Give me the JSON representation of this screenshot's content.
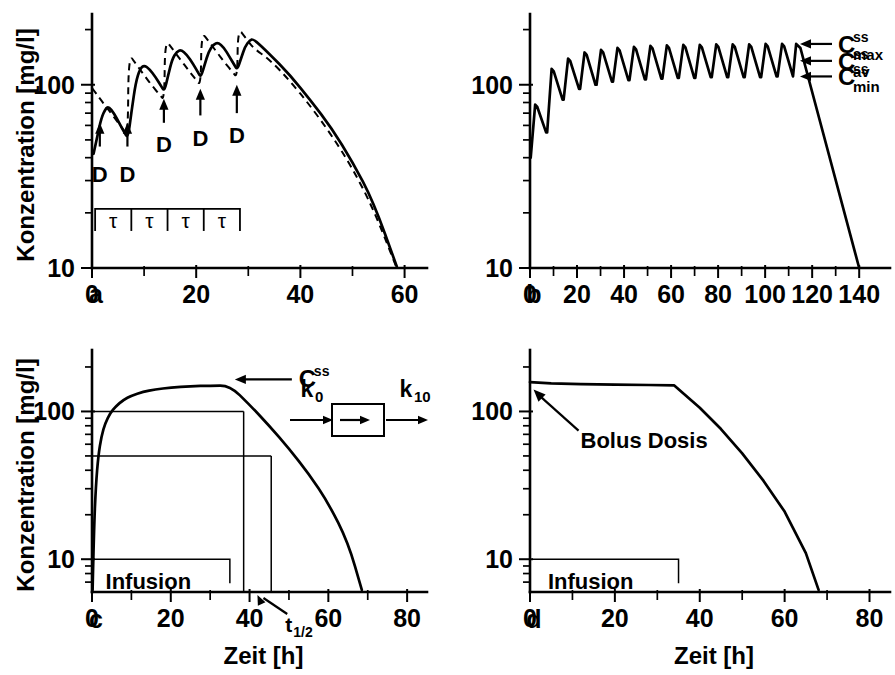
{
  "figure": {
    "background": "#ffffff",
    "ink_color": "#000000"
  },
  "chart_data": [
    {
      "id": "panel-a",
      "type": "line",
      "panel_letter": "a",
      "title": "Multiple oral dosing to steady state",
      "xlabel": "",
      "ylabel": "Konzentration [mg/l]",
      "yscale": "log",
      "ylim": [
        10,
        220
      ],
      "ytick_labels": [
        "100",
        "10"
      ],
      "ytick_values": [
        100,
        10
      ],
      "xlim": [
        0,
        62
      ],
      "xtick_labels": [
        "0",
        "20",
        "40",
        "60"
      ],
      "xtick_values": [
        0,
        20,
        40,
        60
      ],
      "xtick_minor": [
        10,
        30,
        50
      ],
      "grid": false,
      "legend": "none",
      "series": [
        {
          "name": "orale Gabe (solid)",
          "style": "solid",
          "points": [
            [
              0.3,
              42
            ],
            [
              1.0,
              52
            ],
            [
              1.8,
              66
            ],
            [
              2.6,
              74
            ],
            [
              3.2,
              76
            ],
            [
              4.2,
              70
            ],
            [
              5.2,
              62
            ],
            [
              6.2,
              55
            ],
            [
              6.9,
              51
            ],
            [
              7.6,
              72
            ],
            [
              8.4,
              103
            ],
            [
              9.2,
              122
            ],
            [
              10.0,
              128
            ],
            [
              11.0,
              122
            ],
            [
              12.2,
              110
            ],
            [
              13.3,
              98
            ],
            [
              13.9,
              92
            ],
            [
              14.6,
              112
            ],
            [
              15.4,
              138
            ],
            [
              16.3,
              152
            ],
            [
              17.1,
              155
            ],
            [
              18.2,
              146
            ],
            [
              19.4,
              130
            ],
            [
              20.4,
              116
            ],
            [
              20.9,
              110
            ],
            [
              21.6,
              128
            ],
            [
              22.4,
              152
            ],
            [
              23.3,
              166
            ],
            [
              24.2,
              170
            ],
            [
              25.3,
              160
            ],
            [
              26.4,
              142
            ],
            [
              27.4,
              127
            ],
            [
              27.9,
              121
            ],
            [
              28.6,
              139
            ],
            [
              29.4,
              162
            ],
            [
              30.3,
              175
            ],
            [
              31.0,
              178
            ],
            [
              34,
              148
            ],
            [
              38,
              113
            ],
            [
              42,
              82
            ],
            [
              46,
              58
            ],
            [
              50,
              38
            ],
            [
              54,
              23
            ],
            [
              58.5,
              10.2
            ]
          ]
        },
        {
          "name": "i.v. Bolus (dashed)",
          "style": "dashed",
          "points": [
            [
              0.0,
              96
            ],
            [
              1.5,
              84
            ],
            [
              3.0,
              74
            ],
            [
              4.5,
              65
            ],
            [
              6.0,
              57
            ],
            [
              6.9,
              52
            ],
            [
              7.0,
              148
            ],
            [
              8.5,
              129
            ],
            [
              10.0,
              113
            ],
            [
              11.5,
              99
            ],
            [
              13.0,
              88
            ],
            [
              13.9,
              82
            ],
            [
              14.0,
              178
            ],
            [
              15.5,
              156
            ],
            [
              17.0,
              137
            ],
            [
              18.5,
              120
            ],
            [
              20.0,
              106
            ],
            [
              20.9,
              99
            ],
            [
              21.0,
              195
            ],
            [
              22.5,
              171
            ],
            [
              24.0,
              150
            ],
            [
              25.5,
              132
            ],
            [
              27.0,
              117
            ],
            [
              27.9,
              109
            ],
            [
              28.0,
              205
            ],
            [
              29.5,
              180
            ],
            [
              31.0,
              158
            ],
            [
              34,
              138
            ],
            [
              38,
              105
            ],
            [
              42,
              76
            ],
            [
              46,
              53
            ],
            [
              50,
              35
            ],
            [
              54,
              21
            ],
            [
              58.5,
              10.0
            ]
          ]
        }
      ],
      "annotations": [
        {
          "text": "D",
          "x": 1.5,
          "y": 33,
          "kind": "dose-arrow",
          "arrow_from_y": 46,
          "arrow_to_y": 62
        },
        {
          "text": "D",
          "x": 6.8,
          "y": 33,
          "kind": "dose-arrow",
          "arrow_from_y": 46,
          "arrow_to_y": 62
        },
        {
          "text": "D",
          "x": 13.8,
          "y": 48,
          "kind": "dose-arrow",
          "arrow_from_y": 62,
          "arrow_to_y": 84
        },
        {
          "text": "D",
          "x": 20.8,
          "y": 52,
          "kind": "dose-arrow",
          "arrow_from_y": 68,
          "arrow_to_y": 95
        },
        {
          "text": "D",
          "x": 27.8,
          "y": 54,
          "kind": "dose-arrow",
          "arrow_from_y": 70,
          "arrow_to_y": 100
        }
      ],
      "tau_bracket": {
        "label": "τ",
        "count": 4,
        "x_start": 0.6,
        "x_end": 28.4,
        "y_level": 21,
        "labels": [
          "τ",
          "τ",
          "τ",
          "τ"
        ]
      }
    },
    {
      "id": "panel-b",
      "type": "line",
      "panel_letter": "b",
      "title": "Multiple dosing over extended period with steady state levels",
      "xlabel": "",
      "ylabel": "",
      "yscale": "log",
      "ylim": [
        10,
        220
      ],
      "ytick_labels": [
        "100",
        "10"
      ],
      "ytick_values": [
        100,
        10
      ],
      "xlim": [
        0,
        148
      ],
      "xtick_labels": [
        "0",
        "20",
        "40",
        "60",
        "80",
        "100",
        "120",
        "140"
      ],
      "xtick_values": [
        0,
        20,
        40,
        60,
        80,
        100,
        120,
        140
      ],
      "xtick_minor": [
        10,
        30,
        50,
        70,
        90,
        110,
        130
      ],
      "grid": false,
      "legend": "none",
      "dose_interval_h": 7,
      "n_doses": 16,
      "series": [
        {
          "name": "Konzentrationsverlauf",
          "style": "solid",
          "peak_values": [
            78,
            122,
            139,
            150,
            155,
            159,
            161,
            163,
            164,
            165,
            165,
            166,
            166,
            166,
            167,
            167
          ],
          "trough_values": [
            55,
            83,
            95,
            100,
            104,
            106,
            107,
            108,
            109,
            109,
            110,
            110,
            110,
            110,
            111,
            111
          ],
          "terminal_end_x": 140,
          "terminal_end_y": 10
        }
      ],
      "annotations": [
        {
          "text": "C",
          "sup": "ss",
          "sub": "max",
          "kind": "arrow-label",
          "y_value": 167
        },
        {
          "text": "C",
          "sup": "ss",
          "sub": "av",
          "kind": "arrow-label",
          "y_value": 135
        },
        {
          "text": "C",
          "sup": "ss",
          "sub": "min",
          "kind": "arrow-label",
          "y_value": 111
        }
      ]
    },
    {
      "id": "panel-c",
      "type": "line",
      "panel_letter": "c",
      "title": "Constant rate infusion reaching steady state",
      "xlabel": "Zeit [h]",
      "ylabel": "Konzentration [mg/l]",
      "yscale": "log",
      "ylim": [
        6,
        230
      ],
      "ytick_labels": [
        "100",
        "10"
      ],
      "ytick_values": [
        100,
        10
      ],
      "xlim": [
        0,
        82
      ],
      "xtick_labels": [
        "0",
        "20",
        "40",
        "60",
        "80"
      ],
      "xtick_values": [
        0,
        20,
        40,
        60,
        80
      ],
      "xtick_minor": [
        10,
        30,
        50,
        70
      ],
      "grid": false,
      "legend": "none",
      "infusion_stop_h": 35,
      "css_value": 150,
      "half_css_value": 50,
      "hundred_line_value": 100,
      "series": [
        {
          "name": "Infusionskinetik",
          "style": "solid",
          "points": [
            [
              0.15,
              6.2
            ],
            [
              0.5,
              16
            ],
            [
              1.0,
              32
            ],
            [
              1.6,
              50
            ],
            [
              2.4,
              68
            ],
            [
              3.4,
              84
            ],
            [
              4.6,
              97
            ],
            [
              6.0,
              108
            ],
            [
              8.0,
              120
            ],
            [
              10.0,
              128
            ],
            [
              13.0,
              136
            ],
            [
              16.0,
              141
            ],
            [
              20.0,
              145
            ],
            [
              25.0,
              148
            ],
            [
              30.0,
              149.5
            ],
            [
              35.0,
              150
            ],
            [
              40.0,
              111
            ],
            [
              45.0,
              80
            ],
            [
              50.0,
              56
            ],
            [
              55.0,
              38
            ],
            [
              60.0,
              24
            ],
            [
              65.0,
              13
            ],
            [
              68.5,
              6.2
            ]
          ]
        }
      ],
      "annotations": [
        {
          "text": "C",
          "sup": "ss",
          "kind": "css-arrow"
        },
        {
          "text": "Infusion",
          "kind": "infusion-bracket",
          "x_start": 0.5,
          "x_end": 35,
          "y_level": 10
        },
        {
          "text": "t",
          "sub": "1/2",
          "kind": "t-half-arrow",
          "x_first": 38.5,
          "x_second": 45.5
        }
      ],
      "model_box": {
        "input_label": "k",
        "input_sub": "0",
        "output_label": "k",
        "output_sub": "10"
      }
    },
    {
      "id": "panel-d",
      "type": "line",
      "panel_letter": "d",
      "title": "Loading bolus dose plus infusion",
      "xlabel": "Zeit [h]",
      "ylabel": "",
      "yscale": "log",
      "ylim": [
        6,
        230
      ],
      "ytick_labels": [
        "100",
        "10"
      ],
      "ytick_values": [
        100,
        10
      ],
      "xlim": [
        0,
        82
      ],
      "xtick_labels": [
        "0",
        "20",
        "40",
        "60",
        "80"
      ],
      "xtick_values": [
        0,
        20,
        40,
        60,
        80
      ],
      "xtick_minor": [
        10,
        30,
        50,
        70
      ],
      "grid": false,
      "legend": "none",
      "infusion_stop_h": 35,
      "css_value": 152,
      "series": [
        {
          "name": "Bolus + Infusion",
          "style": "solid",
          "points": [
            [
              0.0,
              158
            ],
            [
              5.0,
              155
            ],
            [
              12.0,
              153
            ],
            [
              20.0,
              152
            ],
            [
              28.0,
              151
            ],
            [
              34.0,
              150
            ],
            [
              40.0,
              106
            ],
            [
              45.0,
              76
            ],
            [
              50.0,
              52
            ],
            [
              55.0,
              34
            ],
            [
              60.0,
              21
            ],
            [
              65.0,
              11
            ],
            [
              68.0,
              6.2
            ]
          ]
        }
      ],
      "annotations": [
        {
          "text": "Bolus Dosis",
          "kind": "bolus-arrow"
        },
        {
          "text": "Infusion",
          "kind": "infusion-bracket",
          "x_start": 0.5,
          "x_end": 35,
          "y_level": 10
        }
      ]
    }
  ],
  "labels": {
    "y_axis_title": "Konzentration [mg/l]",
    "x_axis_title": "Zeit [h]",
    "panel_a": "a",
    "panel_b": "b",
    "panel_c": "c",
    "panel_d": "d",
    "dose_marker": "D",
    "tau": "τ",
    "infusion": "Infusion",
    "bolus_dosis": "Bolus Dosis",
    "css": "C",
    "css_sup": "ss",
    "css_max_sub": "max",
    "css_av_sub": "av",
    "css_min_sub": "min",
    "k0": "k",
    "k0_sub": "0",
    "k10": "k",
    "k10_sub": "10",
    "t_half": "t",
    "t_half_sub": "1/2",
    "y_tick_100": "100",
    "y_tick_10": "10"
  }
}
